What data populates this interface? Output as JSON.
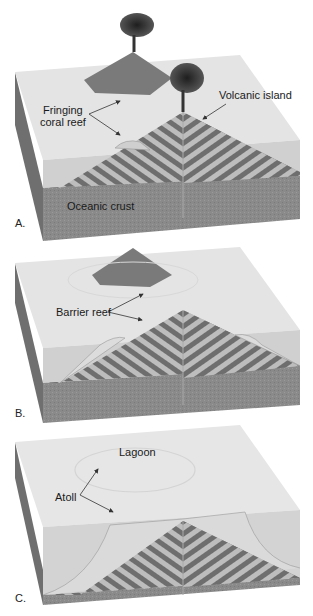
{
  "figure": {
    "colors": {
      "water_surface": "#e6e6e6",
      "water_side": "#cfcfcf",
      "crust": "#8c8c8c",
      "stripe_dark": "#6e6e6e",
      "stripe_light": "#bdbdbd",
      "volcano": "#7a7a7a",
      "plume": "#2e2e2e",
      "reef": "#d9d9d9",
      "arrow": "#333333"
    },
    "panels": [
      {
        "letter": "A.",
        "labels": {
          "fringing_reef": [
            "Fringing",
            "coral reef"
          ],
          "volcanic_island": "Volcanic island",
          "oceanic_crust": "Oceanic crust"
        }
      },
      {
        "letter": "B.",
        "labels": {
          "barrier_reef": "Barrier reef"
        }
      },
      {
        "letter": "C.",
        "labels": {
          "lagoon": "Lagoon",
          "atoll": "Atoll"
        }
      }
    ]
  }
}
